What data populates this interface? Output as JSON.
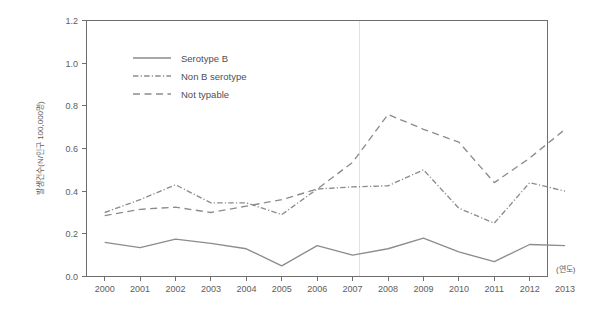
{
  "chart_data": {
    "type": "line",
    "title": "",
    "xlabel": "(연도)",
    "ylabel": "발생건수(N/인구 100,000명)",
    "categories": [
      "2000",
      "2001",
      "2002",
      "2003",
      "2004",
      "2005",
      "2006",
      "2007",
      "2008",
      "2009",
      "2010",
      "2011",
      "2012",
      "2013"
    ],
    "x": [
      2000,
      2001,
      2002,
      2003,
      2004,
      2005,
      2006,
      2007,
      2008,
      2009,
      2010,
      2011,
      2012,
      2013
    ],
    "ylim": [
      0.0,
      1.2
    ],
    "yticks": [
      "0.0",
      "0.2",
      "0.4",
      "0.6",
      "0.8",
      "1.0",
      "1.2"
    ],
    "ytick_values": [
      0.0,
      0.2,
      0.4,
      0.6,
      0.8,
      1.0,
      1.2
    ],
    "grid": false,
    "reference_line_x": 2008,
    "legend_position": "top-left-inside",
    "series": [
      {
        "name": "Serotype B",
        "style": "solid",
        "color": "#8c8c8c",
        "values": [
          0.16,
          0.135,
          0.175,
          0.155,
          0.13,
          0.05,
          0.145,
          0.1,
          0.13,
          0.18,
          0.115,
          0.07,
          0.15,
          0.145
        ]
      },
      {
        "name": "Non B serotype",
        "style": "dash-dot",
        "color": "#8c8c8c",
        "values": [
          0.3,
          0.36,
          0.43,
          0.345,
          0.345,
          0.29,
          0.41,
          0.42,
          0.425,
          0.5,
          0.32,
          0.25,
          0.44,
          0.4
        ]
      },
      {
        "name": "Not typable",
        "style": "dashed",
        "color": "#8c8c8c",
        "values": [
          0.285,
          0.315,
          0.325,
          0.3,
          0.33,
          0.36,
          0.41,
          0.535,
          0.76,
          0.69,
          0.63,
          0.44,
          0.555,
          0.69
        ]
      }
    ]
  },
  "legend": {
    "items": [
      {
        "label": "Serotype B"
      },
      {
        "label": "Non B serotype"
      },
      {
        "label": "Not typable"
      }
    ]
  },
  "colors": {
    "axis": "#6e6e6e",
    "text": "#5d5d5d",
    "line": "#8c8c8c",
    "reference": "#e2e2e2",
    "background": "#ffffff"
  }
}
